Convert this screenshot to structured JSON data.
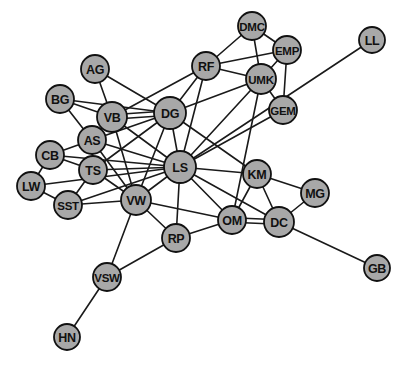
{
  "figure": {
    "type": "network-graph",
    "background_color": "#ffffff",
    "node_fill_color": "#a8a8a8",
    "node_stroke_color": "#111111",
    "edge_color": "#1a1a1a",
    "label_color": "#111111",
    "width": 410,
    "height": 366
  },
  "chart_data": {
    "type": "network",
    "title": "",
    "xlabel": "",
    "ylabel": "",
    "grid": false,
    "legend": "none",
    "node_count": 24,
    "edge_count": 57,
    "nodes": [
      {
        "id": "DMC",
        "label": "DMC",
        "x": 252,
        "y": 26,
        "r": 14
      },
      {
        "id": "EMP",
        "label": "EMP",
        "x": 287,
        "y": 50,
        "r": 14
      },
      {
        "id": "LL",
        "label": "LL",
        "x": 372,
        "y": 40,
        "r": 13
      },
      {
        "id": "RF",
        "label": "RF",
        "x": 206,
        "y": 66,
        "r": 14
      },
      {
        "id": "UMK",
        "label": "UMK",
        "x": 261,
        "y": 79,
        "r": 15
      },
      {
        "id": "AG",
        "label": "AG",
        "x": 95,
        "y": 69,
        "r": 14
      },
      {
        "id": "GEM",
        "label": "GEM",
        "x": 283,
        "y": 110,
        "r": 14
      },
      {
        "id": "BG",
        "label": "BG",
        "x": 60,
        "y": 99,
        "r": 14
      },
      {
        "id": "VB",
        "label": "VB",
        "x": 112,
        "y": 117,
        "r": 15
      },
      {
        "id": "DG",
        "label": "DG",
        "x": 170,
        "y": 113,
        "r": 16
      },
      {
        "id": "AS",
        "label": "AS",
        "x": 92,
        "y": 140,
        "r": 14
      },
      {
        "id": "CB",
        "label": "CB",
        "x": 50,
        "y": 155,
        "r": 14
      },
      {
        "id": "TS",
        "label": "TS",
        "x": 93,
        "y": 170,
        "r": 14
      },
      {
        "id": "LS",
        "label": "LS",
        "x": 180,
        "y": 167,
        "r": 16
      },
      {
        "id": "KM",
        "label": "KM",
        "x": 257,
        "y": 174,
        "r": 14
      },
      {
        "id": "LW",
        "label": "LW",
        "x": 31,
        "y": 186,
        "r": 14
      },
      {
        "id": "MG",
        "label": "MG",
        "x": 315,
        "y": 193,
        "r": 14
      },
      {
        "id": "VW",
        "label": "VW",
        "x": 136,
        "y": 200,
        "r": 15
      },
      {
        "id": "SST",
        "label": "SST",
        "x": 68,
        "y": 205,
        "r": 14
      },
      {
        "id": "OM",
        "label": "OM",
        "x": 232,
        "y": 220,
        "r": 14
      },
      {
        "id": "DC",
        "label": "DC",
        "x": 279,
        "y": 222,
        "r": 15
      },
      {
        "id": "RP",
        "label": "RP",
        "x": 176,
        "y": 238,
        "r": 14
      },
      {
        "id": "GB",
        "label": "GB",
        "x": 377,
        "y": 268,
        "r": 13
      },
      {
        "id": "VSW",
        "label": "VSW",
        "x": 107,
        "y": 277,
        "r": 14
      },
      {
        "id": "HN",
        "label": "HN",
        "x": 67,
        "y": 337,
        "r": 13
      }
    ],
    "edges": [
      [
        "DMC",
        "RF"
      ],
      [
        "DMC",
        "EMP"
      ],
      [
        "DMC",
        "UMK"
      ],
      [
        "EMP",
        "UMK"
      ],
      [
        "EMP",
        "RF"
      ],
      [
        "EMP",
        "GEM"
      ],
      [
        "RF",
        "UMK"
      ],
      [
        "RF",
        "DG"
      ],
      [
        "RF",
        "VB"
      ],
      [
        "RF",
        "LS"
      ],
      [
        "UMK",
        "GEM"
      ],
      [
        "UMK",
        "DG"
      ],
      [
        "UMK",
        "LS"
      ],
      [
        "UMK",
        "OM"
      ],
      [
        "LL",
        "LS"
      ],
      [
        "GEM",
        "LS"
      ],
      [
        "AG",
        "VB"
      ],
      [
        "AG",
        "DG"
      ],
      [
        "BG",
        "VB"
      ],
      [
        "BG",
        "AS"
      ],
      [
        "BG",
        "DG"
      ],
      [
        "VB",
        "DG"
      ],
      [
        "VB",
        "AS"
      ],
      [
        "VB",
        "VW"
      ],
      [
        "VB",
        "LS"
      ],
      [
        "DG",
        "AS"
      ],
      [
        "DG",
        "LS"
      ],
      [
        "DG",
        "VW"
      ],
      [
        "DG",
        "TS"
      ],
      [
        "DG",
        "KM"
      ],
      [
        "AS",
        "TS"
      ],
      [
        "AS",
        "CB"
      ],
      [
        "AS",
        "LS"
      ],
      [
        "AS",
        "VW"
      ],
      [
        "CB",
        "TS"
      ],
      [
        "CB",
        "LW"
      ],
      [
        "CB",
        "LS"
      ],
      [
        "TS",
        "SST"
      ],
      [
        "TS",
        "VW"
      ],
      [
        "TS",
        "LS"
      ],
      [
        "LW",
        "SST"
      ],
      [
        "LW",
        "LS"
      ],
      [
        "SST",
        "VW"
      ],
      [
        "SST",
        "LS"
      ],
      [
        "LS",
        "VW"
      ],
      [
        "LS",
        "KM"
      ],
      [
        "LS",
        "RP"
      ],
      [
        "LS",
        "OM"
      ],
      [
        "LS",
        "DC"
      ],
      [
        "KM",
        "OM"
      ],
      [
        "KM",
        "DC"
      ],
      [
        "KM",
        "MG"
      ],
      [
        "MG",
        "DC"
      ],
      [
        "OM",
        "DC"
      ],
      [
        "OM",
        "RP"
      ],
      [
        "OM",
        "VW"
      ],
      [
        "DC",
        "GB"
      ],
      [
        "VW",
        "RP"
      ],
      [
        "VW",
        "VSW"
      ],
      [
        "RP",
        "VSW"
      ],
      [
        "VSW",
        "HN"
      ]
    ],
    "parallel_edges": [
      [
        "VB",
        "DG"
      ],
      [
        "OM",
        "DC"
      ]
    ]
  }
}
